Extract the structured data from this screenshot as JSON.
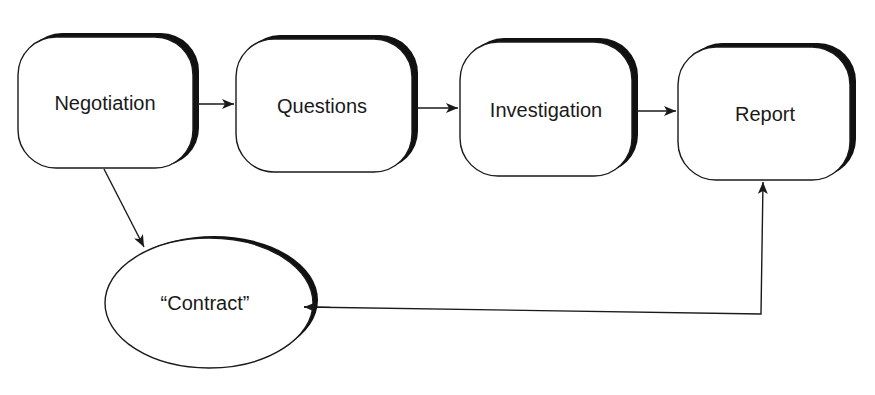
{
  "diagram": {
    "type": "process-flow",
    "colors": {
      "stroke": "#1a1a1a",
      "shadow": "#111111",
      "fill": "#ffffff"
    },
    "nodes": [
      {
        "id": "negotiation",
        "label": "Negotiation",
        "shape": "rounded-rect"
      },
      {
        "id": "questions",
        "label": "Questions",
        "shape": "rounded-rect"
      },
      {
        "id": "investigation",
        "label": "Investigation",
        "shape": "rounded-rect"
      },
      {
        "id": "report",
        "label": "Report",
        "shape": "rounded-rect"
      },
      {
        "id": "contract",
        "label": "“Contract”",
        "shape": "ellipse"
      }
    ],
    "edges": [
      {
        "from": "negotiation",
        "to": "questions"
      },
      {
        "from": "questions",
        "to": "investigation"
      },
      {
        "from": "investigation",
        "to": "report"
      },
      {
        "from": "negotiation",
        "to": "contract"
      },
      {
        "from": "contract",
        "to": "report",
        "bidirectional": true
      }
    ]
  }
}
